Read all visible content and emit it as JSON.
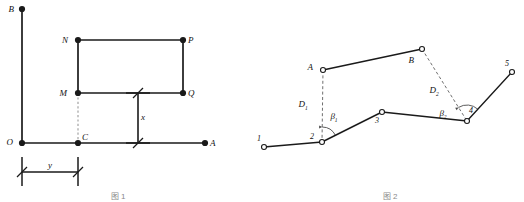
{
  "page": {
    "background": "#ffffff",
    "ink": "#1a1a1a",
    "width": 524,
    "height": 201
  },
  "figure_left": {
    "name": "rectangle-setback-dimension-diagram",
    "axis_vertical": {
      "from_label": "O",
      "to_label": "B"
    },
    "axis_horizontal": {
      "from_label": "O",
      "to_label": "A"
    },
    "points": [
      {
        "id": "B",
        "label": "B",
        "x": 22,
        "y": 9,
        "label_dx": -8,
        "label_dy": 3,
        "marker": "filled"
      },
      {
        "id": "O",
        "label": "O",
        "x": 22,
        "y": 143,
        "label_dx": -9,
        "label_dy": 2,
        "marker": "filled"
      },
      {
        "id": "A",
        "label": "A",
        "x": 205,
        "y": 143,
        "label_dx": 5,
        "label_dy": 3,
        "marker": "filled"
      },
      {
        "id": "N",
        "label": "N",
        "x": 78,
        "y": 40,
        "label_dx": -10,
        "label_dy": 3,
        "marker": "filled"
      },
      {
        "id": "P",
        "label": "P",
        "x": 183,
        "y": 40,
        "label_dx": 5,
        "label_dy": 3,
        "marker": "filled"
      },
      {
        "id": "M",
        "label": "M",
        "x": 78,
        "y": 93,
        "label_dx": -11,
        "label_dy": 3,
        "marker": "filled"
      },
      {
        "id": "Q",
        "label": "Q",
        "x": 183,
        "y": 93,
        "label_dx": 5,
        "label_dy": 3,
        "marker": "filled"
      },
      {
        "id": "C",
        "label": "C",
        "x": 78,
        "y": 143,
        "label_dx": 4,
        "label_dy": -3,
        "marker": "filled"
      }
    ],
    "solid_edges": [
      {
        "from": "O",
        "to": "B"
      },
      {
        "from": "O",
        "to": "A"
      },
      {
        "from": "M",
        "to": "N"
      },
      {
        "from": "N",
        "to": "P"
      },
      {
        "from": "P",
        "to": "Q"
      },
      {
        "from": "M",
        "to": "Q"
      }
    ],
    "dashed_edges": [
      {
        "from": "M",
        "to": "C"
      }
    ],
    "dimensions": [
      {
        "id": "dim-y",
        "label": "y",
        "orientation": "horizontal",
        "line_y": 172,
        "from_x": 22,
        "to_x": 78,
        "ext_top": 157,
        "ext_bottom": 186,
        "label_x": 50,
        "label_y": 168
      },
      {
        "id": "dim-x",
        "label": "x",
        "orientation": "vertical",
        "line_x": 138,
        "from_y": 93,
        "to_y": 143,
        "ext_left": 126,
        "ext_right": 150,
        "label_x": 143,
        "label_y": 120
      }
    ],
    "caption": "图 1"
  },
  "figure_right": {
    "name": "traverse-survey-diagram",
    "stations": [
      {
        "id": "1",
        "label": "1",
        "x": 264,
        "y": 147,
        "label_dx": -3,
        "label_dy": -6,
        "marker": "open"
      },
      {
        "id": "2",
        "label": "2",
        "x": 322,
        "y": 142,
        "label_dx": -8,
        "label_dy": -3,
        "marker": "open"
      },
      {
        "id": "3",
        "label": "3",
        "x": 382,
        "y": 112,
        "label_dx": -3,
        "label_dy": 11,
        "marker": "open"
      },
      {
        "id": "4",
        "label": "4",
        "x": 467,
        "y": 121,
        "label_dx": 2,
        "label_dy": -8,
        "marker": "open"
      },
      {
        "id": "5",
        "label": "5",
        "x": 512,
        "y": 72,
        "label_dx": -3,
        "label_dy": -6,
        "marker": "open"
      }
    ],
    "reference_points": [
      {
        "id": "A",
        "label": "A",
        "x": 323,
        "y": 70,
        "label_dx": -10,
        "label_dy": 0,
        "marker": "open"
      },
      {
        "id": "B",
        "label": "B",
        "x": 422,
        "y": 49,
        "label_dx": -8,
        "label_dy": 14,
        "marker": "open"
      }
    ],
    "traverse_legs": [
      {
        "from": "1",
        "to": "2"
      },
      {
        "from": "2",
        "to": "3"
      },
      {
        "from": "3",
        "to": "4"
      },
      {
        "from": "4",
        "to": "5"
      }
    ],
    "reference_leg": {
      "from": "A",
      "to": "B"
    },
    "connectors": [
      {
        "id": "D1",
        "label": "D",
        "subscript": "1",
        "from": "A",
        "to": "2",
        "label_x": 303,
        "label_y": 107
      },
      {
        "id": "D2",
        "label": "D",
        "subscript": "2",
        "from": "B",
        "to": "4",
        "label_x": 434,
        "label_y": 93
      }
    ],
    "angles": [
      {
        "id": "beta1",
        "label": "β",
        "subscript": "1",
        "at": "2",
        "label_x": 334,
        "label_y": 119,
        "radius": 15
      },
      {
        "id": "beta2",
        "label": "β",
        "subscript": "2",
        "at": "4",
        "label_x": 443,
        "label_y": 116,
        "radius": 16
      }
    ],
    "caption": "图 2"
  }
}
